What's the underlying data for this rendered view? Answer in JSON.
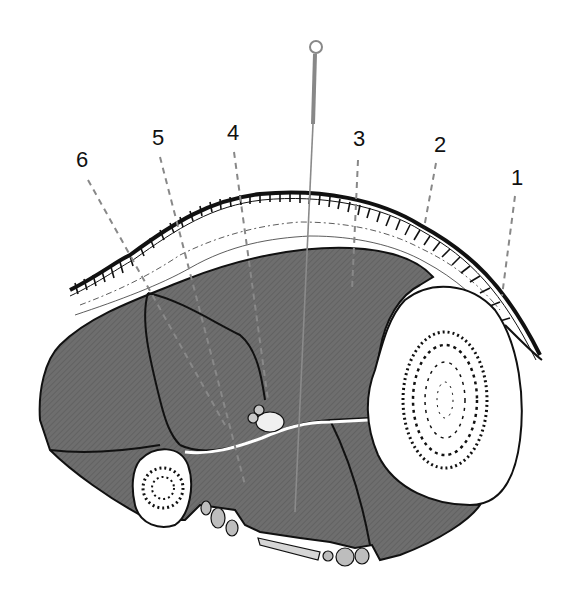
{
  "diagram": {
    "type": "anatomical-cross-section",
    "colors": {
      "background": "#ffffff",
      "muscle": "#6e6e6e",
      "muscle_hatch": "#5a5a5a",
      "outline": "#111111",
      "leader_line": "#888888",
      "needle": "#8a8a8a",
      "bone": "#ffffff",
      "vessel": "#bdbdbd"
    },
    "needle": {
      "ring": {
        "cx": 316,
        "cy": 47,
        "r": 6
      },
      "handle": {
        "x1": 315,
        "y1": 55,
        "x2": 313,
        "y2": 124
      },
      "shaft": {
        "x1": 313,
        "y1": 124,
        "x2": 295,
        "y2": 510
      }
    },
    "labels": [
      {
        "id": "1",
        "text": "1",
        "x": 517,
        "y": 178,
        "line": {
          "x1": 515,
          "y1": 196,
          "x2": 502,
          "y2": 296
        }
      },
      {
        "id": "2",
        "text": "2",
        "x": 440,
        "y": 145,
        "line": {
          "x1": 436,
          "y1": 163,
          "x2": 424,
          "y2": 228
        }
      },
      {
        "id": "3",
        "text": "3",
        "x": 359,
        "y": 139,
        "line": {
          "x1": 358,
          "y1": 160,
          "x2": 352,
          "y2": 290
        }
      },
      {
        "id": "4",
        "text": "4",
        "x": 233,
        "y": 133,
        "line": {
          "x1": 234,
          "y1": 152,
          "x2": 268,
          "y2": 400
        }
      },
      {
        "id": "5",
        "text": "5",
        "x": 158,
        "y": 138,
        "line": {
          "x1": 160,
          "y1": 157,
          "x2": 245,
          "y2": 485
        }
      },
      {
        "id": "6",
        "text": "6",
        "x": 82,
        "y": 160,
        "line": {
          "x1": 88,
          "y1": 180,
          "x2": 225,
          "y2": 425
        }
      }
    ]
  }
}
